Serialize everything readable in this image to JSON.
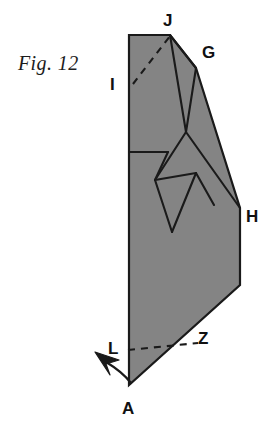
{
  "figure": {
    "caption": "Fig. 12",
    "background_color": "#ffffff",
    "fill_color": "#848484",
    "stroke_color": "#1a1a1a",
    "label_color": "#111111"
  },
  "labels": {
    "j": "J",
    "g": "G",
    "i": "I",
    "h": "H",
    "l": "L",
    "z": "Z",
    "a": "A"
  },
  "diagram": {
    "type": "origami-fold-step",
    "outline_points": "129,35 170,35 196,68 240,208 240,285 129,385",
    "crease_lines": [
      {
        "name": "j-to-g",
        "points": "170,35 196,68"
      },
      {
        "name": "j-to-mid",
        "points": "170,35 186,132"
      },
      {
        "name": "g-down-to-mid",
        "points": "196,68 186,132"
      },
      {
        "name": "mid-to-lower-left",
        "points": "186,132 155,180"
      },
      {
        "name": "mid-to-h",
        "points": "186,132 240,208"
      },
      {
        "name": "horizontal-crease",
        "points": "129,152 168,152"
      },
      {
        "name": "horizontal-to-lower",
        "points": "168,152 155,180"
      },
      {
        "name": "kite-upper-right",
        "points": "155,180 196,173"
      },
      {
        "name": "kite-lower-right",
        "points": "155,180 172,232"
      },
      {
        "name": "kite-right-diag",
        "points": "172,232 196,173"
      },
      {
        "name": "v-notch-right",
        "points": "196,173 214,205"
      }
    ],
    "dashed_lines": [
      {
        "name": "i-to-j-dashed",
        "points": "133,84 170,36"
      },
      {
        "name": "l-to-z-dashed",
        "points": "128,350 198,343"
      }
    ],
    "arrow": {
      "name": "fold-arrow",
      "tail": "131,383",
      "curve": "M 131,383 C 124,374 116,368 106,362",
      "head_tip": "97,355"
    }
  },
  "label_positions": {
    "j": {
      "left": 163,
      "top": 12
    },
    "g": {
      "left": 202,
      "top": 44
    },
    "i": {
      "left": 110,
      "top": 76
    },
    "h": {
      "left": 246,
      "top": 208
    },
    "l": {
      "left": 108,
      "top": 340
    },
    "z": {
      "left": 198,
      "top": 330
    },
    "a": {
      "left": 122,
      "top": 400
    }
  }
}
